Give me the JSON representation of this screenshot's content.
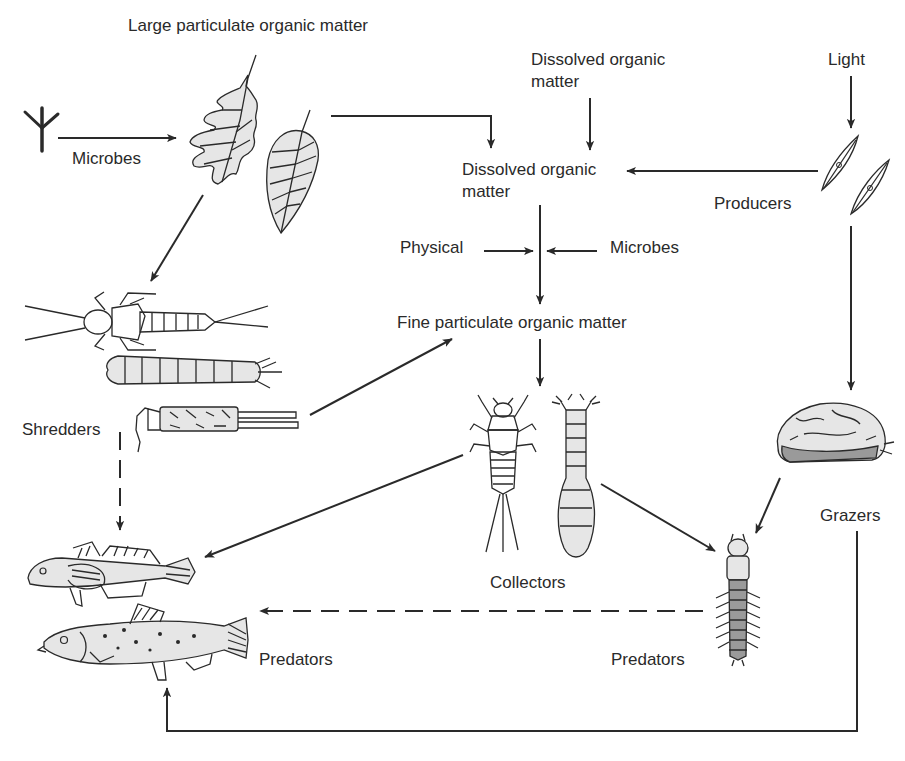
{
  "diagram": {
    "type": "stream ecosystem energy flow / food web",
    "nodes": {
      "lpom": {
        "label": "Large particulate organic matter"
      },
      "microbes_top": {
        "label": "Microbes"
      },
      "dom_input": {
        "label_line1": "Dissolved organic",
        "label_line2": "matter"
      },
      "light": {
        "label": "Light"
      },
      "dom": {
        "label_line1": "Dissolved organic",
        "label_line2": "matter"
      },
      "producers": {
        "label": "Producers"
      },
      "physical": {
        "label": "Physical"
      },
      "microbes_mid": {
        "label": "Microbes"
      },
      "fpom": {
        "label": "Fine particulate organic matter"
      },
      "shredders": {
        "label": "Shredders"
      },
      "collectors": {
        "label": "Collectors"
      },
      "grazers": {
        "label": "Grazers"
      },
      "predators_fish": {
        "label": "Predators"
      },
      "predators_insect": {
        "label": "Predators"
      }
    },
    "illustrations": [
      {
        "id": "fungal-hypha",
        "name": "microbe-hypha-icon"
      },
      {
        "id": "oak-leaf",
        "name": "oak-leaf-icon"
      },
      {
        "id": "elm-leaf",
        "name": "elm-leaf-icon"
      },
      {
        "id": "diatoms",
        "name": "diatom-icon"
      },
      {
        "id": "stonefly-nymph",
        "name": "stonefly-nymph-icon"
      },
      {
        "id": "cranefly-larva",
        "name": "cranefly-larva-icon"
      },
      {
        "id": "caddisfly-case",
        "name": "caddisfly-case-icon"
      },
      {
        "id": "mayfly-nymph",
        "name": "mayfly-nymph-icon"
      },
      {
        "id": "blackfly-larva",
        "name": "blackfly-larva-icon"
      },
      {
        "id": "snail-caddis-case",
        "name": "grazer-case-icon"
      },
      {
        "id": "hellgrammite",
        "name": "hellgrammite-icon"
      },
      {
        "id": "sculpin",
        "name": "sculpin-fish-icon"
      },
      {
        "id": "trout",
        "name": "trout-fish-icon"
      }
    ],
    "edges": [
      {
        "from": "microbes_top",
        "to": "lpom",
        "style": "solid"
      },
      {
        "from": "lpom",
        "to": "dom",
        "style": "solid"
      },
      {
        "from": "dom_input",
        "to": "dom",
        "style": "solid"
      },
      {
        "from": "light",
        "to": "producers",
        "style": "solid"
      },
      {
        "from": "producers",
        "to": "dom",
        "style": "solid"
      },
      {
        "from": "dom",
        "to": "fpom",
        "style": "solid"
      },
      {
        "from": "physical",
        "to": "fpom",
        "style": "solid"
      },
      {
        "from": "microbes_mid",
        "to": "fpom",
        "style": "solid"
      },
      {
        "from": "lpom",
        "to": "shredders",
        "style": "solid"
      },
      {
        "from": "shredders",
        "to": "fpom",
        "style": "solid"
      },
      {
        "from": "fpom",
        "to": "collectors",
        "style": "solid"
      },
      {
        "from": "producers",
        "to": "grazers",
        "style": "solid"
      },
      {
        "from": "shredders",
        "to": "predators_fish",
        "style": "dashed"
      },
      {
        "from": "collectors",
        "to": "predators_fish",
        "style": "solid"
      },
      {
        "from": "collectors",
        "to": "predators_insect",
        "style": "solid"
      },
      {
        "from": "grazers",
        "to": "predators_insect",
        "style": "solid"
      },
      {
        "from": "predators_insect",
        "to": "predators_fish",
        "style": "dashed"
      },
      {
        "from": "grazers",
        "to": "predators_fish",
        "style": "solid"
      }
    ]
  }
}
